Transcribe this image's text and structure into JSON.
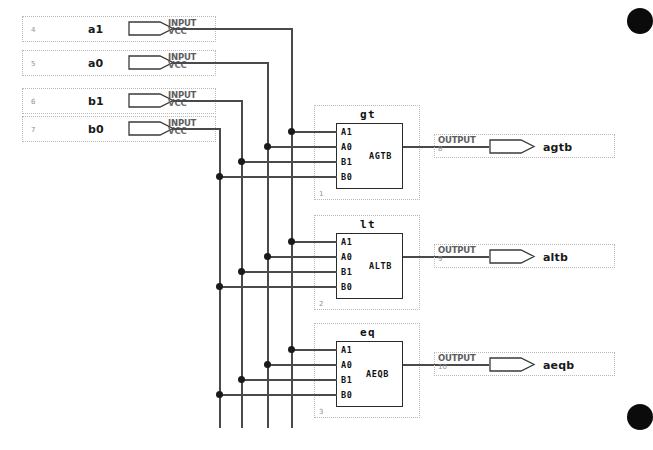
{
  "diagram": {
    "type": "logic-schematic",
    "canvas": {
      "width": 646,
      "height": 450
    },
    "colors": {
      "wire": "#4a4a4a",
      "junction": "#1a1a1a",
      "block_border": "#2b2b2b",
      "dotted_border": "#b9b9b9",
      "label": "#1a1a1a",
      "pin_type_label": "#5d5d5d",
      "pin_number": "#8f8f8f",
      "background": "#ffffff"
    },
    "inputs": [
      {
        "name": "a1",
        "type_label": "INPUT",
        "default_label": "VCC",
        "pin_number": "4"
      },
      {
        "name": "a0",
        "type_label": "INPUT",
        "default_label": "VCC",
        "pin_number": "5"
      },
      {
        "name": "b1",
        "type_label": "INPUT",
        "default_label": "VCC",
        "pin_number": "6"
      },
      {
        "name": "b0",
        "type_label": "INPUT",
        "default_label": "VCC",
        "pin_number": "7"
      }
    ],
    "blocks": [
      {
        "name": "gt",
        "instance_number": "1",
        "inputs": [
          "A1",
          "A0",
          "B1",
          "B0"
        ],
        "output": "AGTB"
      },
      {
        "name": "lt",
        "instance_number": "2",
        "inputs": [
          "A1",
          "A0",
          "B1",
          "B0"
        ],
        "output": "ALTB"
      },
      {
        "name": "eq",
        "instance_number": "3",
        "inputs": [
          "A1",
          "A0",
          "B1",
          "B0"
        ],
        "output": "AEQB"
      }
    ],
    "outputs": [
      {
        "name": "agtb",
        "type_label": "OUTPUT",
        "pin_number": "8",
        "from_block": "gt"
      },
      {
        "name": "altb",
        "type_label": "OUTPUT",
        "pin_number": "9",
        "from_block": "lt"
      },
      {
        "name": "aeqb",
        "type_label": "OUTPUT",
        "pin_number": "10",
        "from_block": "eq"
      }
    ]
  }
}
